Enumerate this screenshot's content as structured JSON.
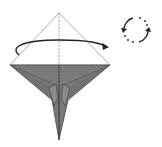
{
  "diagram": {
    "type": "origami-fold-step",
    "instruction": "turn model over",
    "colors": {
      "paper_front": "#ffffff",
      "paper_back": "#7a7a7a",
      "paper_dark": "#5e5e5e",
      "line": "#3a3a3a",
      "arrow": "#222222"
    },
    "symbols": [
      {
        "name": "turn-over-arrow",
        "meaning": "flip model"
      },
      {
        "name": "rotate-symbol",
        "meaning": "turn over / rotate"
      }
    ]
  }
}
